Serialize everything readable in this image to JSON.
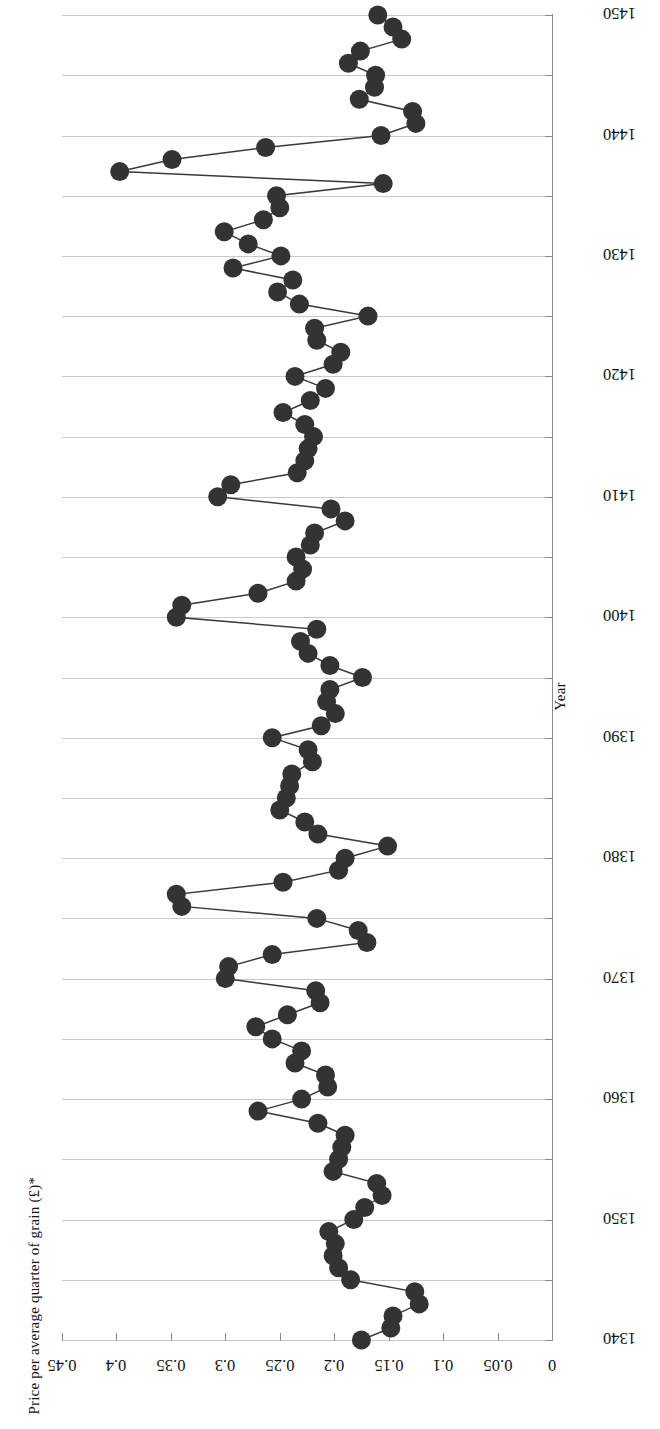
{
  "figure": {
    "background": "#ffffff",
    "orientation": "rotated-90-landscape-printed-sideways",
    "marker_color": "#333333",
    "line_color": "#3a3a3a",
    "gridline_color": "#c9c9c9",
    "axis_color": "#8a8a8a"
  },
  "axes": {
    "price_axis_title": "Price per average quarter of grain (£)*",
    "year_axis_title": "Year",
    "price_ticks": [
      "0.45",
      "0.4",
      "0.35",
      "0.3",
      "0.25",
      "0.2",
      "0.15",
      "0.1",
      "0.05",
      "0"
    ],
    "price_tick_values": [
      0.45,
      0.4,
      0.35,
      0.3,
      0.25,
      0.2,
      0.15,
      0.1,
      0.05,
      0
    ],
    "year_ticks": [
      "1340",
      "1350",
      "1360",
      "1370",
      "1380",
      "1390",
      "1400",
      "1410",
      "1420",
      "1430",
      "1440",
      "1450"
    ],
    "year_tick_values": [
      1340,
      1350,
      1360,
      1370,
      1380,
      1390,
      1400,
      1410,
      1420,
      1430,
      1440,
      1450
    ],
    "year_minor_step": 5
  },
  "chart_data": {
    "type": "line",
    "title": "",
    "subtitle": "",
    "xlabel": "Year",
    "ylabel": "Price per average quarter of grain (£)*",
    "xlim": [
      1340,
      1450
    ],
    "ylim": [
      0,
      0.45
    ],
    "grid": "horizontal-every-5-years",
    "legend": "none",
    "markers": "filled-circle",
    "series": [
      {
        "name": "Price per average quarter of grain",
        "x": [
          1340,
          1341,
          1342,
          1343,
          1344,
          1345,
          1346,
          1347,
          1348,
          1349,
          1350,
          1351,
          1352,
          1353,
          1354,
          1355,
          1356,
          1357,
          1358,
          1359,
          1360,
          1361,
          1362,
          1363,
          1364,
          1365,
          1366,
          1367,
          1368,
          1369,
          1370,
          1371,
          1372,
          1373,
          1374,
          1375,
          1376,
          1377,
          1378,
          1379,
          1380,
          1381,
          1382,
          1383,
          1384,
          1385,
          1386,
          1387,
          1388,
          1389,
          1390,
          1391,
          1392,
          1393,
          1394,
          1395,
          1396,
          1397,
          1398,
          1399,
          1400,
          1401,
          1402,
          1403,
          1404,
          1405,
          1406,
          1407,
          1408,
          1409,
          1410,
          1411,
          1412,
          1413,
          1414,
          1415,
          1416,
          1417,
          1418,
          1419,
          1420,
          1421,
          1422,
          1423,
          1424,
          1425,
          1426,
          1427,
          1428,
          1429,
          1430,
          1431,
          1432,
          1433,
          1434,
          1435,
          1436,
          1437,
          1438,
          1439,
          1440,
          1441,
          1442,
          1443,
          1444,
          1445,
          1446,
          1447,
          1448,
          1449,
          1450
        ],
        "y": [
          0.175,
          0.148,
          0.146,
          0.122,
          0.126,
          0.185,
          0.196,
          0.201,
          0.199,
          0.205,
          0.182,
          0.172,
          0.156,
          0.161,
          0.201,
          0.196,
          0.193,
          0.19,
          0.215,
          0.27,
          0.23,
          0.206,
          0.208,
          0.236,
          0.23,
          0.257,
          0.272,
          0.243,
          0.213,
          0.217,
          0.3,
          0.297,
          0.257,
          0.17,
          0.178,
          0.216,
          0.34,
          0.345,
          0.247,
          0.196,
          0.19,
          0.151,
          0.215,
          0.227,
          0.25,
          0.244,
          0.241,
          0.239,
          0.22,
          0.224,
          0.257,
          0.212,
          0.199,
          0.207,
          0.204,
          0.174,
          0.204,
          0.224,
          0.231,
          0.216,
          0.345,
          0.34,
          0.27,
          0.235,
          0.229,
          0.235,
          0.222,
          0.218,
          0.19,
          0.203,
          0.307,
          0.295,
          0.234,
          0.227,
          0.224,
          0.219,
          0.227,
          0.247,
          0.222,
          0.208,
          0.236,
          0.201,
          0.194,
          0.216,
          0.218,
          0.169,
          0.232,
          0.252,
          0.238,
          0.293,
          0.249,
          0.279,
          0.301,
          0.265,
          0.25,
          0.253,
          0.155,
          0.397,
          0.349,
          0.263,
          0.157,
          0.125,
          0.128,
          0.177,
          0.163,
          0.162,
          0.187,
          0.176,
          0.138,
          0.146,
          0.16
        ]
      }
    ]
  }
}
